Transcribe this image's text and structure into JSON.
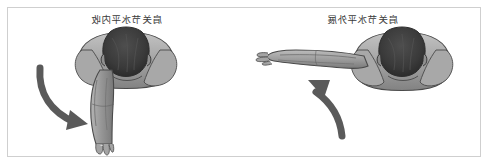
{
  "figure": {
    "background_color": "#ffffff",
    "frame_color": "#cfcfcf",
    "palette": {
      "skin_light": "#b9b9b9",
      "skin_mid": "#9a9a9a",
      "skin_shadow": "#7d7d7d",
      "outline": "#4a4a4a",
      "hair_dark": "#3c3c3c",
      "arrow": "#5a5a5a",
      "text": "#3a3a3a"
    },
    "orientation_note": "mirrored",
    "panels": [
      {
        "id": "left",
        "label": "肩关节水平内收",
        "figure_name": "torso-top-view",
        "arm_position": "arm-hanging-down",
        "arrow": {
          "name": "curved-arrow-down-right",
          "direction": "down-right"
        }
      },
      {
        "id": "right",
        "label": "肩关节水平外展",
        "figure_name": "torso-top-view",
        "arm_position": "arm-extended-horizontal",
        "arrow": {
          "name": "curved-arrow-up-left",
          "direction": "up-left"
        }
      }
    ]
  }
}
